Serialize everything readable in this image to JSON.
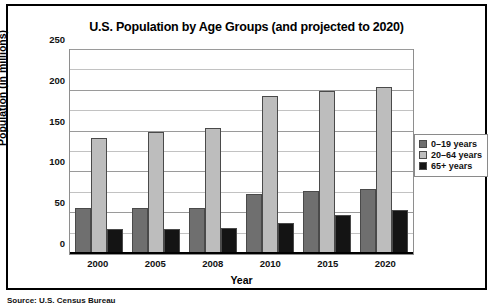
{
  "figure": {
    "source_note": "Source: U.S. Census Bureau"
  },
  "chart_data": {
    "type": "bar",
    "title": "U.S. Population by Age Groups (and projected to 2020)",
    "xlabel": "Year",
    "ylabel": "Population (in millions)",
    "categories": [
      "2000",
      "2005",
      "2008",
      "2010",
      "2015",
      "2020"
    ],
    "ylim": [
      0,
      250
    ],
    "yticks": [
      0,
      50,
      100,
      150,
      200,
      250
    ],
    "ytick_labels": [
      "0",
      "50",
      "100",
      "150",
      "200",
      "250"
    ],
    "minor_tick_interval": 25,
    "grid": true,
    "legend_position": "right",
    "series": [
      {
        "name": "0–19 years",
        "color": "#6f6f6f",
        "values": [
          57,
          57,
          57,
          74,
          77,
          80
        ]
      },
      {
        "name": "20–64 years",
        "color": "#bdbdbd",
        "values": [
          142,
          150,
          155,
          194,
          200,
          205
        ]
      },
      {
        "name": "65+ years",
        "color": "#141414",
        "values": [
          31,
          31,
          32,
          38,
          48,
          54
        ]
      }
    ]
  }
}
